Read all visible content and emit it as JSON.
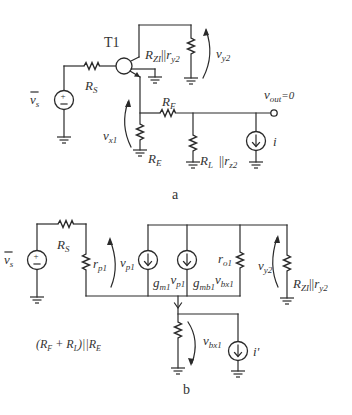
{
  "figure": {
    "panel_a": {
      "caption": "a",
      "transistor_label": "T1",
      "source_label_v": "v",
      "source_label_sub": "s",
      "rs_label": "R",
      "rs_sub": "S",
      "load_collector_label": "R",
      "load_collector_sub1": "ZI",
      "load_collector_par": "||",
      "load_collector_r": "r",
      "load_collector_sub2": "y2",
      "vy2_label": "v",
      "vy2_sub": "y2",
      "rf_label": "R",
      "rf_sub": "F",
      "vout_label": "v",
      "vout_sub": "out",
      "vout_value": "=0",
      "vx1_label": "v",
      "vx1_sub": "x1",
      "re_label": "R",
      "re_sub": "E",
      "rl_label": "R",
      "rl_sub": "L",
      "rl_par": "||",
      "rz2_r": "r",
      "rz2_sub": "z2",
      "current_label": "i"
    },
    "panel_b": {
      "caption": "b",
      "source_label_v": "v",
      "source_label_sub": "s",
      "rs_label": "R",
      "rs_sub": "S",
      "rp1_label": "r",
      "rp1_sub": "p1",
      "vp1_label": "v",
      "vp1_sub": "p1",
      "gm1_g": "g",
      "gm1_sub": "m1",
      "gm1_v": "v",
      "gm1_vsub": "p1",
      "gmb1_g": "g",
      "gmb1_sub": "mb1",
      "gmb1_v": "v",
      "gmb1_vsub": "bx1",
      "ro1_label": "r",
      "ro1_sub": "o1",
      "vy2_label": "v",
      "vy2_sub": "y2",
      "rzi_label": "R",
      "rzi_sub": "ZI",
      "rzi_par": "||",
      "ry2_r": "r",
      "ry2_sub": "y2",
      "emitter_load_label": "(R",
      "emitter_load_sub1": "F",
      "emitter_load_plus": " + R",
      "emitter_load_sub2": "L",
      "emitter_load_close": ")||R",
      "emitter_load_sub3": "E",
      "vbx1_label": "v",
      "vbx1_sub": "bx1",
      "current_label": "i'"
    }
  }
}
